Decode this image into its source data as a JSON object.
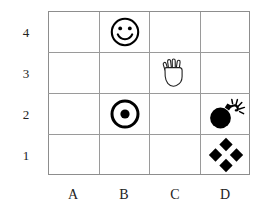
{
  "board": {
    "title": "4x4 grid puzzle board",
    "columns": [
      "A",
      "B",
      "C",
      "D"
    ],
    "rows": [
      "4",
      "3",
      "2",
      "1"
    ],
    "grid_line_color": "#9a9a9a",
    "background_color": "#ffffff",
    "icon_color": "#000000",
    "label_color": "#222222",
    "cells": [
      {
        "id": "B4",
        "column": "B",
        "row": "4",
        "icon": "smiley-face-icon",
        "label": "smiley face"
      },
      {
        "id": "C3",
        "column": "C",
        "row": "3",
        "icon": "open-hand-icon",
        "label": "open hand"
      },
      {
        "id": "B2",
        "column": "B",
        "row": "2",
        "icon": "bullseye-target-icon",
        "label": "bullseye target"
      },
      {
        "id": "D2",
        "column": "D",
        "row": "2",
        "icon": "bomb-icon",
        "label": "lit bomb"
      },
      {
        "id": "D1",
        "column": "D",
        "row": "1",
        "icon": "four-diamonds-icon",
        "label": "four diamonds"
      }
    ],
    "empty_cells": [
      "A4",
      "C4",
      "D4",
      "A3",
      "B3",
      "D3",
      "A2",
      "C2",
      "A1",
      "B1",
      "C1"
    ]
  }
}
